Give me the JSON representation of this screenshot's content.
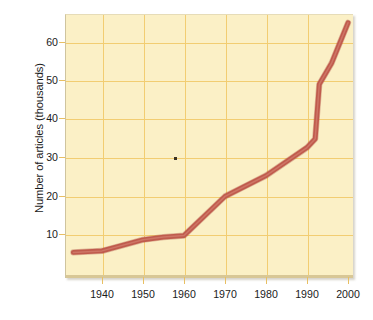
{
  "chart_data": {
    "type": "line",
    "title": "",
    "xlabel": "",
    "ylabel": "Number of articles (thousands)",
    "xlim": [
      1933,
      2000
    ],
    "ylim": [
      0,
      68
    ],
    "grid": true,
    "legend": "none",
    "x_ticks": [
      1940,
      1950,
      1960,
      1970,
      1980,
      1990,
      2000
    ],
    "y_ticks": [
      10,
      20,
      30,
      40,
      50,
      60
    ],
    "series": [
      {
        "name": "Number of articles",
        "color": "#c05b4d",
        "x": [
          1933,
          1940,
          1950,
          1955,
          1960,
          1970,
          1975,
          1980,
          1990,
          1992,
          1993,
          1996,
          2000
        ],
        "values": [
          5.2,
          5.6,
          8.5,
          9.2,
          9.6,
          19.8,
          22.5,
          25.2,
          32.5,
          34.8,
          49.0,
          54.5,
          65.0
        ]
      }
    ]
  },
  "axes": {
    "y_title": "Number of articles (thousands)",
    "y_tick_labels": [
      "60",
      "50",
      "40",
      "30",
      "20",
      "10"
    ],
    "x_tick_labels": [
      "1940",
      "1950",
      "1960",
      "1970",
      "1980",
      "1990",
      "2000"
    ]
  },
  "colors": {
    "plot_background": "#fbf0c6",
    "gridline": "#f2cd72",
    "line": "#c05b4d",
    "line_highlight": "#d88a7a",
    "tick_text": "#1a1a1a",
    "page_background": "#ffffff"
  }
}
